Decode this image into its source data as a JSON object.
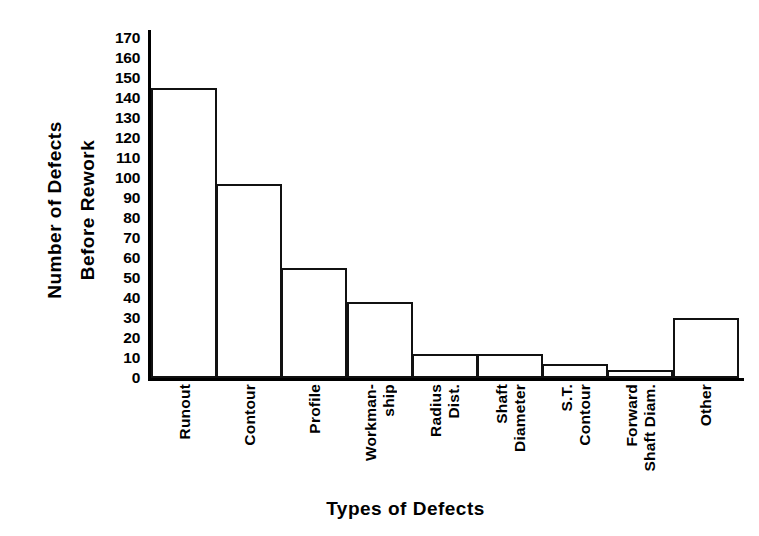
{
  "chart_data": {
    "type": "bar",
    "title": "",
    "xlabel": "Types of Defects",
    "ylabel": "Number of Defects Before Rework",
    "ylabel_lines": [
      "Number of Defects",
      "Before Rework"
    ],
    "categories": [
      "Runout",
      "Contour",
      "Profile",
      "Workman-ship",
      "Radius Dist.",
      "Shaft Diameter",
      "S.T. Contour",
      "Forward Shaft Diam.",
      "Other"
    ],
    "category_lines": [
      [
        "Runout"
      ],
      [
        "Contour"
      ],
      [
        "Profile"
      ],
      [
        "Workman-",
        "ship"
      ],
      [
        "Radius",
        "Dist."
      ],
      [
        "Shaft",
        "Diameter"
      ],
      [
        "S.T.",
        "Contour"
      ],
      [
        "Forward",
        "Shaft Diam."
      ],
      [
        "Other"
      ]
    ],
    "values": [
      145,
      97,
      55,
      38,
      12,
      12,
      7,
      4,
      30
    ],
    "ylim": [
      0,
      170
    ],
    "ytick_step": 10,
    "yticks": [
      170,
      160,
      150,
      140,
      130,
      120,
      110,
      100,
      90,
      80,
      70,
      60,
      50,
      40,
      30,
      20,
      10,
      0
    ],
    "grid": false,
    "legend": false,
    "bar_fill": "#ffffff",
    "bar_edge": "#111111",
    "axis_color": "#000000",
    "background": "#ffffff"
  }
}
